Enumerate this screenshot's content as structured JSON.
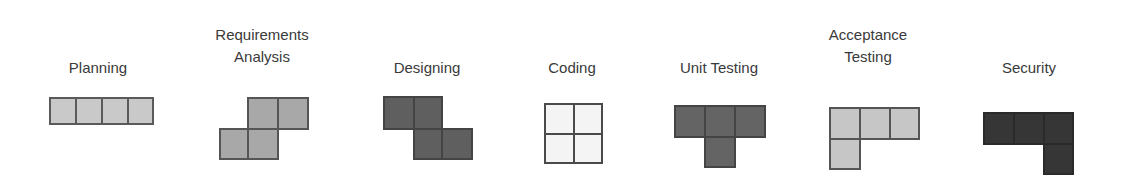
{
  "diagram": {
    "title": "",
    "stages": [
      {
        "id": "planning",
        "label_lines": [
          "Planning"
        ],
        "shape": "I",
        "fill": "#c9c9c9",
        "border": "#5a5a5a"
      },
      {
        "id": "requirements",
        "label_lines": [
          "Requirements",
          "Analysis"
        ],
        "shape": "S",
        "fill": "#a8a8a8",
        "border": "#555555"
      },
      {
        "id": "designing",
        "label_lines": [
          "Designing"
        ],
        "shape": "Z",
        "fill": "#5f5f5f",
        "border": "#3f3f3f"
      },
      {
        "id": "coding",
        "label_lines": [
          "Coding"
        ],
        "shape": "O",
        "fill": "#f4f4f4",
        "border": "#4a4a4a"
      },
      {
        "id": "unit-testing",
        "label_lines": [
          "Unit Testing"
        ],
        "shape": "T",
        "fill": "#646464",
        "border": "#3f3f3f"
      },
      {
        "id": "acceptance-testing",
        "label_lines": [
          "Acceptance",
          "Testing"
        ],
        "shape": "L",
        "fill": "#c6c6c6",
        "border": "#555555"
      },
      {
        "id": "security",
        "label_lines": [
          "Security"
        ],
        "shape": "J",
        "fill": "#363636",
        "border": "#2a2a2a"
      }
    ]
  }
}
